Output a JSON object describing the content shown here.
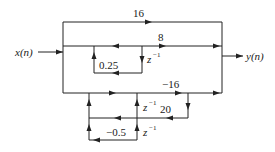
{
  "diagram": {
    "type": "signal-flow-graph",
    "input_label": "x(n)",
    "output_label": "y(n)",
    "gains": {
      "top_feedforward": "16",
      "middle_feedforward": "8",
      "upper_feedback": "0.25",
      "lower_feedforward": "−16",
      "lower_branch": "20",
      "lower_feedback": "−0.5"
    },
    "delays": {
      "upper_delay": "z",
      "upper_delay_exp": "−1",
      "lower_delay_1": "z",
      "lower_delay_1_exp": "−1",
      "lower_delay_2": "z",
      "lower_delay_2_exp": "−1"
    },
    "colors": {
      "line": "#222222",
      "background": "#ffffff"
    }
  }
}
